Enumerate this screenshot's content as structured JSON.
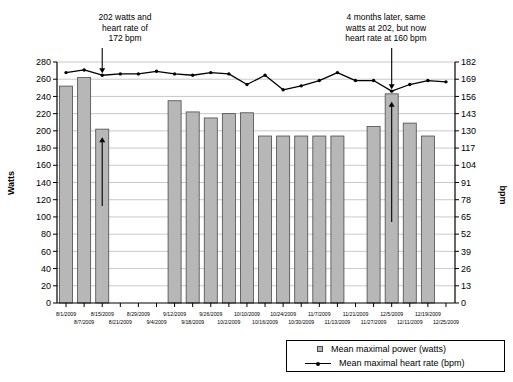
{
  "chart_data": {
    "type": "bar",
    "title": "",
    "subtitle": "",
    "xlabel": "",
    "ylabel": "Watts",
    "y2label": "bpm",
    "ylim": [
      0,
      280
    ],
    "y2lim": [
      0,
      182
    ],
    "yticks": [
      0,
      20,
      40,
      60,
      80,
      100,
      120,
      140,
      160,
      180,
      200,
      220,
      240,
      260,
      280
    ],
    "y2ticks": [
      0,
      13,
      26,
      39,
      52,
      65,
      78,
      91,
      104,
      117,
      130,
      143,
      156,
      169,
      182
    ],
    "grid": true,
    "legend_position": "bottom-right",
    "categories": [
      "8/1/2009",
      "8/7/2009",
      "8/15/2009",
      "8/21/2009",
      "8/29/2009",
      "9/4/2009",
      "9/12/2009",
      "9/18/2009",
      "9/26/2009",
      "10/2/2009",
      "10/10/2009",
      "10/16/2009",
      "10/24/2009",
      "10/30/2009",
      "11/7/2009",
      "11/13/2009",
      "11/21/2009",
      "11/27/2009",
      "12/5/2009",
      "12/11/2009",
      "12/19/2009",
      "12/25/2009"
    ],
    "tick_labels_top": [
      "8/1/2009",
      "8/15/2009",
      "8/29/2009",
      "9/12/2009",
      "9/26/2009",
      "10/10/2009",
      "10/24/2009",
      "11/7/2009",
      "11/21/2009",
      "12/5/2009",
      "12/19/2009"
    ],
    "tick_labels_bottom": [
      "8/7/2009",
      "8/21/2009",
      "9/4/2009",
      "9/18/2009",
      "10/2/2009",
      "10/16/2009",
      "10/30/2009",
      "11/13/2009",
      "11/27/2009",
      "12/11/2009",
      "12/25/2009"
    ],
    "series": [
      {
        "name": "Mean maximal power (watts)",
        "axis": "left",
        "kind": "bar",
        "color": "#b7b7b7",
        "edge_color": "#4a4a4a",
        "values": [
          252,
          262,
          202,
          null,
          null,
          null,
          235,
          222,
          215,
          220,
          221,
          194,
          194,
          194,
          194,
          194,
          null,
          205,
          243,
          209,
          194,
          null
        ]
      },
      {
        "name": "Mean maximal heart rate (bpm)",
        "axis": "right",
        "kind": "line",
        "color": "#000000",
        "values": [
          174,
          176,
          172,
          173,
          173,
          175,
          173,
          172,
          174,
          173,
          165,
          172,
          161,
          164,
          168,
          174,
          168,
          168,
          160,
          165,
          168,
          167
        ]
      }
    ],
    "annotations": [
      {
        "id": "annotation-left",
        "text": "202 watts and\nheart rate of\n172 bpm",
        "points_to_category": "8/15/2009",
        "arrow": "down"
      },
      {
        "id": "annotation-right",
        "text": "4 months later, same\nwatts at 202, but now\nheart rate at 160 bpm",
        "points_to_category": "12/5/2009",
        "arrow": "down"
      }
    ],
    "callout_arrows": [
      {
        "id": "bar-callout-left",
        "category": "8/15/2009",
        "direction": "up"
      },
      {
        "id": "bar-callout-right",
        "category": "12/5/2009",
        "direction": "up"
      }
    ],
    "legend": [
      {
        "label": "Mean maximal power (watts)",
        "marker": "square"
      },
      {
        "label": "Mean maximal heart rate (bpm)",
        "marker": "line-point"
      }
    ]
  },
  "colors": {
    "bar_fill": "#b7b7b7",
    "bar_edge": "#4a4a4a",
    "line": "#000000",
    "grid": "#b0b0b0",
    "axis": "#000000",
    "background": "#ffffff"
  }
}
